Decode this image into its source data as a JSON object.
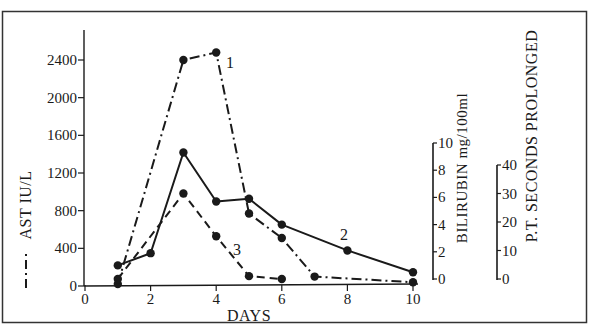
{
  "chart_data": {
    "type": "line",
    "title": "",
    "xlabel": "DAYS",
    "x_ticks": [
      "0",
      "2",
      "4",
      "6",
      "8",
      "10"
    ],
    "xlim": [
      0,
      10
    ],
    "axes": [
      {
        "id": "ast",
        "label": "AST IU/L",
        "legend_style": "dash-dot",
        "position": "left",
        "range": [
          0,
          2400
        ],
        "ticks": [
          "0",
          "400",
          "800",
          "1200",
          "1600",
          "2000",
          "2400"
        ]
      },
      {
        "id": "bilirubin",
        "label": "BILIRUBIN mg/100ml",
        "position": "right-inner",
        "range": [
          0,
          10
        ],
        "ticks": [
          "0",
          "2",
          "4",
          "6",
          "8",
          "10"
        ]
      },
      {
        "id": "pt",
        "label": "P.T. SECONDS PROLONGED",
        "position": "right-outer",
        "range": [
          0,
          40
        ],
        "ticks": [
          "0",
          "10",
          "20",
          "30",
          "40"
        ]
      }
    ],
    "series": [
      {
        "name": "1",
        "axis": "ast",
        "style": "dash-dot",
        "x": [
          1,
          3,
          4,
          5,
          6,
          7,
          10
        ],
        "values": [
          20,
          2400,
          2480,
          770,
          510,
          100,
          40
        ]
      },
      {
        "name": "2",
        "axis": "bilirubin",
        "style": "solid",
        "x": [
          1,
          2,
          3,
          4,
          5,
          6,
          8,
          10
        ],
        "values": [
          1.0,
          1.9,
          9.3,
          5.7,
          5.9,
          4.0,
          2.1,
          0.5
        ]
      },
      {
        "name": "3",
        "axis": "pt",
        "style": "dashed",
        "x": [
          1,
          3,
          4,
          5,
          6
        ],
        "values": [
          0,
          30,
          15,
          1,
          0
        ]
      }
    ],
    "grid": false,
    "legend": "inline numeric labels 1, 2, 3 beside curves"
  },
  "labels": {
    "x_axis_title": "DAYS",
    "ast_axis_title": "AST   IU/L",
    "bilirubin_axis_title": "BILIRUBIN mg/100ml",
    "pt_axis_title": "P.T. SECONDS PROLONGED",
    "series1_label": "1",
    "series2_label": "2",
    "series3_label": "3"
  },
  "colors": {
    "ink": "#1a1a1a",
    "background": "#ffffff",
    "frame": "#333333"
  }
}
